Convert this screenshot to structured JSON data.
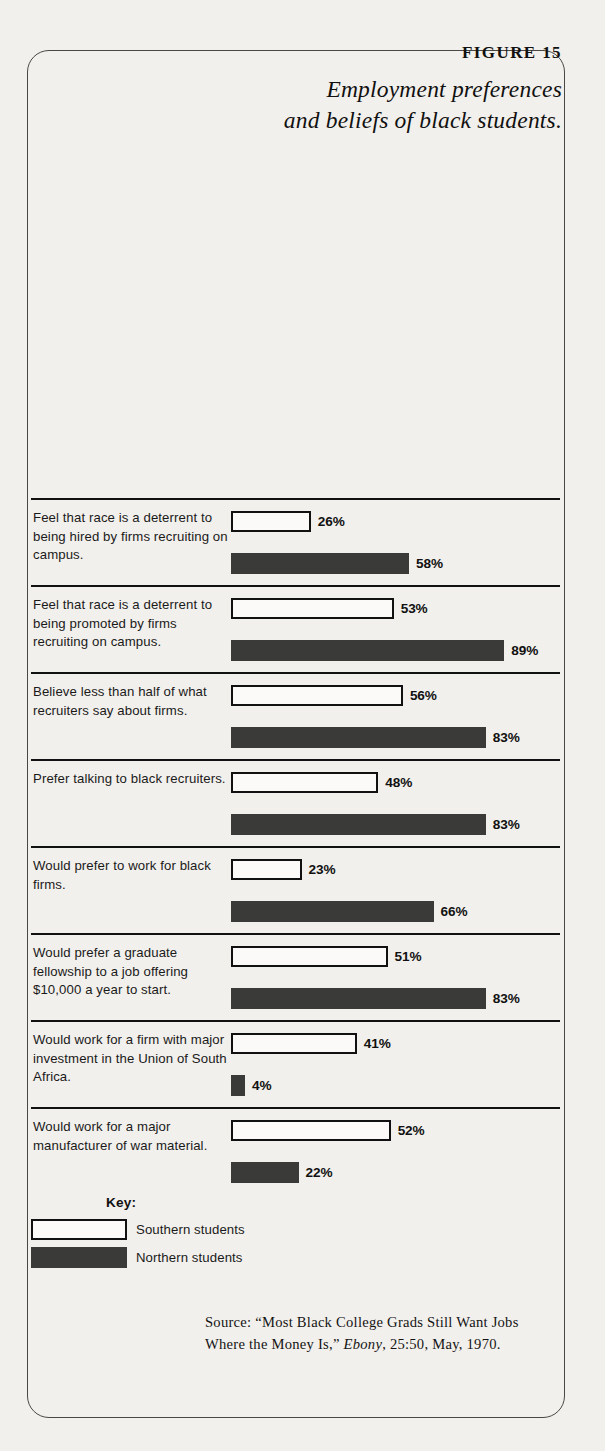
{
  "figure": {
    "number_label": "FIGURE 15",
    "title": "Employment preferences and beliefs of black students."
  },
  "key": {
    "title": "Key:",
    "entries": [
      {
        "label": "Southern students",
        "series": "south",
        "color": "#ffffff"
      },
      {
        "label": "Northern students",
        "series": "north",
        "color": "#3a3a38"
      }
    ]
  },
  "source": {
    "prefix": "Source: “Most Black College Grads Still Want Jobs Where the Money Is,” ",
    "italic": "Ebony",
    "suffix": ", 25:50, May, 1970."
  },
  "chart_data": {
    "type": "bar",
    "title": "Employment preferences and beliefs of black students.",
    "orientation": "horizontal",
    "xlabel": "",
    "ylabel": "",
    "xlim": [
      0,
      100
    ],
    "unit": "%",
    "grid": false,
    "legend_position": "bottom-left",
    "categories": [
      "Feel that race is a deterrent to being hired by firms recruiting on campus.",
      "Feel that race is a deterrent to being promoted by firms recruiting on campus.",
      "Believe less than half of what recruiters say about firms.",
      "Prefer talking to black recruiters.",
      "Would prefer to work for black firms.",
      "Would prefer a graduate fellowship to a job offering $10,000 a year to start.",
      "Would work for a firm with major investment in the Union of South Africa.",
      "Would work for a major manufacturer of war material."
    ],
    "series": [
      {
        "name": "Southern students",
        "values": [
          26,
          53,
          56,
          48,
          23,
          51,
          41,
          52
        ]
      },
      {
        "name": "Northern students",
        "values": [
          58,
          89,
          83,
          83,
          66,
          83,
          4,
          22
        ]
      }
    ]
  },
  "rows": [
    {
      "label": "Feel that race is a deterrent to being hired by firms recruiting on campus.",
      "south_value": 26,
      "south_text": "26%",
      "north_value": 58,
      "north_text": "58%"
    },
    {
      "label": "Feel that race is a deterrent to being promoted by firms recruiting on campus.",
      "south_value": 53,
      "south_text": "53%",
      "north_value": 89,
      "north_text": "89%"
    },
    {
      "label": "Believe less than half of what recruiters say about firms.",
      "south_value": 56,
      "south_text": "56%",
      "north_value": 83,
      "north_text": "83%"
    },
    {
      "label": "Prefer talking to black recruiters.",
      "south_value": 48,
      "south_text": "48%",
      "north_value": 83,
      "north_text": "83%"
    },
    {
      "label": "Would prefer to work for black firms.",
      "south_value": 23,
      "south_text": "23%",
      "north_value": 66,
      "north_text": "66%"
    },
    {
      "label": "Would prefer a graduate fellowship to a job offering $10,000 a year to start.",
      "south_value": 51,
      "south_text": "51%",
      "north_value": 83,
      "north_text": "83%"
    },
    {
      "label": "Would work for a firm with major investment in the Union of South Africa.",
      "south_value": 41,
      "south_text": "41%",
      "north_value": 4,
      "north_text": "4%"
    },
    {
      "label": "Would work for a major manufacturer of war material.",
      "south_value": 52,
      "south_text": "52%",
      "north_value": 22,
      "north_text": "22%"
    }
  ]
}
